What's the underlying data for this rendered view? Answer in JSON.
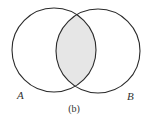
{
  "diagram": {
    "type": "venn",
    "sets": [
      {
        "label": "A"
      },
      {
        "label": "B"
      }
    ],
    "shaded_region": "A ∩ B",
    "caption": "(b)",
    "colors": {
      "stroke": "#2a2a2a",
      "shade": "#e6e6e6",
      "background": "#ffffff"
    }
  }
}
